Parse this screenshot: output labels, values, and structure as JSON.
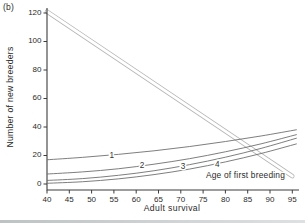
{
  "panel_label": "(b)",
  "colors": {
    "text": "#2b2b2b",
    "axis": "#3c3c3c",
    "curve": "#6f6f6f",
    "band_edge": "#b5b5b5",
    "band_fill": "#ffffff"
  },
  "chart_data": {
    "type": "line",
    "title": "",
    "xlabel": "Adult survival",
    "ylabel": "Number of new breeders",
    "xlim": [
      40,
      95
    ],
    "ylim": [
      0,
      120
    ],
    "xticks": [
      40,
      45,
      50,
      55,
      60,
      65,
      70,
      75,
      80,
      85,
      90,
      95
    ],
    "yticks": [
      0,
      20,
      40,
      60,
      80,
      100,
      120
    ],
    "grid": false,
    "legend": "none",
    "annotation": {
      "text": "Age of first breeding",
      "x": 84.5,
      "y": 4.2
    },
    "series": [
      {
        "name": "adult-survival-line",
        "label": "",
        "style": "double-line",
        "points": [
          [
            40,
            121
          ],
          [
            95,
            5.5
          ]
        ]
      },
      {
        "name": "age-1",
        "label": "1",
        "style": "curve",
        "label_at": [
          54.5,
          20.2
        ],
        "points": [
          [
            40,
            17
          ],
          [
            48,
            18.7
          ],
          [
            56,
            20.8
          ],
          [
            64,
            23.3
          ],
          [
            72,
            26.3
          ],
          [
            80,
            29.8
          ],
          [
            88,
            33.7
          ],
          [
            96,
            38.1
          ]
        ]
      },
      {
        "name": "age-2",
        "label": "2",
        "style": "curve",
        "label_at": [
          61.3,
          13.2
        ],
        "points": [
          [
            40,
            7
          ],
          [
            48,
            8.5
          ],
          [
            56,
            10.7
          ],
          [
            64,
            13.9
          ],
          [
            72,
            17.8
          ],
          [
            80,
            22.6
          ],
          [
            88,
            28.2
          ],
          [
            96,
            34.7
          ]
        ]
      },
      {
        "name": "age-3",
        "label": "3",
        "style": "curve",
        "label_at": [
          70.5,
          12.7
        ],
        "points": [
          [
            40,
            2.5
          ],
          [
            48,
            3.8
          ],
          [
            56,
            6.1
          ],
          [
            64,
            9.3
          ],
          [
            72,
            13.6
          ],
          [
            80,
            18.8
          ],
          [
            88,
            25.0
          ],
          [
            96,
            32.2
          ]
        ]
      },
      {
        "name": "age-4",
        "label": "4",
        "style": "curve",
        "label_at": [
          78.2,
          13.9
        ],
        "points": [
          [
            40,
            0.5
          ],
          [
            48,
            1.6
          ],
          [
            56,
            3.6
          ],
          [
            64,
            6.6
          ],
          [
            72,
            10.5
          ],
          [
            80,
            15.5
          ],
          [
            88,
            21.4
          ],
          [
            96,
            28.2
          ]
        ]
      }
    ]
  }
}
